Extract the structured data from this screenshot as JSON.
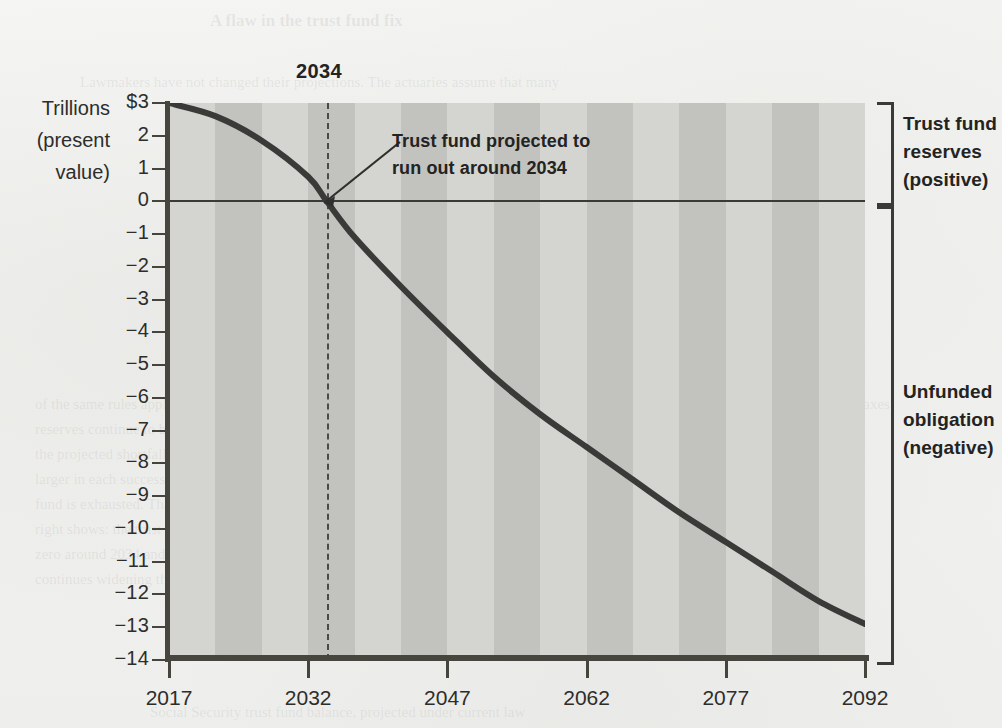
{
  "chart_data": {
    "type": "line",
    "title": "",
    "subtitle": "",
    "xlabel": "",
    "ylabel": "Trillions (present value)",
    "x": [
      2017,
      2022,
      2027,
      2032,
      2034,
      2037,
      2042,
      2047,
      2052,
      2057,
      2062,
      2067,
      2072,
      2077,
      2082,
      2087,
      2092
    ],
    "values": [
      3.0,
      2.6,
      1.85,
      0.75,
      0.0,
      -1.1,
      -2.6,
      -4.0,
      -5.35,
      -6.5,
      -7.5,
      -8.5,
      -9.5,
      -10.4,
      -11.3,
      -12.2,
      -12.9
    ],
    "series": [
      {
        "name": "Social Security trust fund (present value)",
        "values": [
          3.0,
          2.6,
          1.85,
          0.75,
          0.0,
          -1.1,
          -2.6,
          -4.0,
          -5.35,
          -6.5,
          -7.5,
          -8.5,
          -9.5,
          -10.4,
          -11.3,
          -12.2,
          -12.9
        ]
      }
    ],
    "xlim": [
      2017,
      2092
    ],
    "ylim": [
      -14,
      3
    ],
    "grid": false,
    "legend": false,
    "x_tick_labels": [
      "2017",
      "2032",
      "2047",
      "2062",
      "2077",
      "2092"
    ],
    "x_tick_values": [
      2017,
      2032,
      2047,
      2062,
      2077,
      2092
    ],
    "y_tick_labels": [
      "$3",
      "2",
      "1",
      "0",
      "−1",
      "−2",
      "−3",
      "−4",
      "−5",
      "−6",
      "−7",
      "−8",
      "−9",
      "−10",
      "−11",
      "−12",
      "−13",
      "−14"
    ],
    "y_tick_values": [
      3,
      2,
      1,
      0,
      -1,
      -2,
      -3,
      -4,
      -5,
      -6,
      -7,
      -8,
      -9,
      -10,
      -11,
      -12,
      -13,
      -14
    ],
    "zero_reference_line": 0,
    "crossing_year": 2034,
    "annotations": [
      {
        "name": "crossing-year-label",
        "text": "2034"
      },
      {
        "name": "callout",
        "text": "Trust fund projected to run out around 2034"
      }
    ],
    "brackets": [
      {
        "name": "positive",
        "text": "Trust fund reserves (positive)",
        "range": [
          0,
          3
        ]
      },
      {
        "name": "negative",
        "text": "Unfunded obligation (negative)",
        "range": [
          -14,
          0
        ]
      }
    ],
    "colors": {
      "line": "#3a3a38",
      "plot_background": "#cfcfcd",
      "band_light": "#d4d4d1",
      "band_dark": "#c2c2bf",
      "axis": "#46463f",
      "text": "#232321",
      "page_background": "#f2f2f0"
    }
  },
  "axis_title": {
    "line1": "Trillions",
    "line2": "(present",
    "line3": "value)"
  },
  "callout": {
    "year": "2034",
    "line1": "Trust fund projected to",
    "line2": "run out around 2034"
  },
  "brackets": {
    "positive": {
      "line1": "Trust fund",
      "line2": "reserves",
      "line3": "(positive)"
    },
    "negative": {
      "line1": "Unfunded",
      "line2": "obligation",
      "line3": "(negative)"
    }
  },
  "ghost_text": {
    "l1": "A flaw in the trust fund fix",
    "l2": "Lawmakers have not changed their projections. The actuaries assume that many",
    "l3": "of the same rules apply and the trust fund",
    "l4": "reserves continue to build over time with",
    "l5": "the projected shortfall growing larger and",
    "l6": "larger in each successive decade after the",
    "l7": "fund is exhausted. That is what the chart at",
    "l8": "right shows: the trust fund balance falls to",
    "l9": "zero around 2034 and the unfunded gap",
    "l10": "continues widening through 2092.",
    "l11": "The program would still collect payroll taxes",
    "l12": "after the reserves are gone, but those",
    "l13": "receipts would cover only about three",
    "l14": "quarters of scheduled benefits.",
    "l15": "Social Security trust fund balance, projected under current law"
  }
}
